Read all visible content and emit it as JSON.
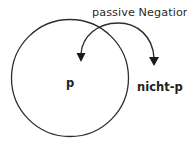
{
  "diagram": {
    "title": "passive Negation",
    "inside_label": "p",
    "outside_label": "nicht-p",
    "colors": {
      "stroke": "#2e2e2e",
      "arrowhead": "#1a1a1a",
      "text": "#1e1e1e",
      "background": "#ffffff"
    },
    "shapes": {
      "circle": {
        "cx": 70,
        "cy": 78,
        "r": 58
      },
      "arc": {
        "description": "Double-headed curved arrow spanning from inside circle to outside",
        "start": [
          81,
          54
        ],
        "peak": [
          118,
          24
        ],
        "end": [
          154,
          58
        ]
      },
      "arrowheads": [
        {
          "name": "inside-arrowhead",
          "tip": [
            81,
            62
          ]
        },
        {
          "name": "outside-arrowhead",
          "tip": [
            154,
            66
          ]
        }
      ]
    }
  }
}
